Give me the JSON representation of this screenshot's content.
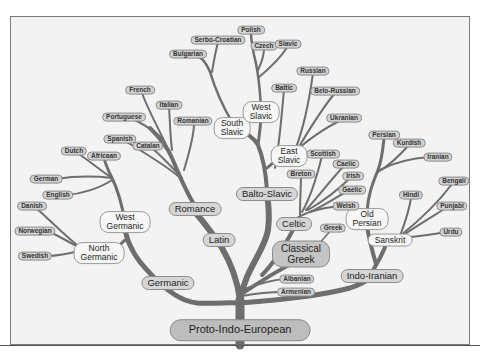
{
  "diagram": {
    "root": {
      "label": "Proto-Indo-European",
      "x": 240,
      "y": 330
    },
    "major_branches": [
      {
        "label": "Germanic",
        "x": 168,
        "y": 283,
        "style": "branch"
      },
      {
        "label": "Latin",
        "x": 219,
        "y": 240,
        "style": "branch"
      },
      {
        "label": "Romance",
        "x": 195,
        "y": 209,
        "style": "branch"
      },
      {
        "label": "Balto-Slavic",
        "x": 267,
        "y": 194,
        "style": "branch"
      },
      {
        "label": "Celtic",
        "x": 294,
        "y": 224,
        "style": "branch"
      },
      {
        "label": "Classical Greek",
        "x": 301,
        "y": 254,
        "style": "big",
        "lines": [
          "Classical",
          "Greek"
        ]
      },
      {
        "label": "Indo-Iranian",
        "x": 372,
        "y": 276,
        "style": "branch"
      }
    ],
    "sub_branches": [
      {
        "label": "West Germanic",
        "x": 125,
        "y": 222,
        "lines": [
          "West",
          "Germanic"
        ]
      },
      {
        "label": "North Germanic",
        "x": 99,
        "y": 253,
        "lines": [
          "North",
          "Germanic"
        ]
      },
      {
        "label": "South Slavic",
        "x": 232,
        "y": 128,
        "lines": [
          "South",
          "Slavic"
        ]
      },
      {
        "label": "West Slavic",
        "x": 261,
        "y": 112,
        "lines": [
          "West",
          "Slavic"
        ]
      },
      {
        "label": "East Slavic",
        "x": 289,
        "y": 156,
        "lines": [
          "East",
          "Slavic"
        ]
      },
      {
        "label": "Old Persian",
        "x": 367,
        "y": 219,
        "lines": [
          "Old",
          "Persian"
        ]
      },
      {
        "label": "Sanskrit",
        "x": 390,
        "y": 240,
        "lines": [
          "Sanskrit"
        ]
      }
    ],
    "languages": [
      {
        "label": "Polish",
        "x": 251,
        "y": 30
      },
      {
        "label": "Serbo-Croatian",
        "x": 218,
        "y": 40
      },
      {
        "label": "Czech",
        "x": 264,
        "y": 46
      },
      {
        "label": "Slavic",
        "x": 288,
        "y": 44
      },
      {
        "label": "Bulgarian",
        "x": 188,
        "y": 54
      },
      {
        "label": "Russian",
        "x": 313,
        "y": 71
      },
      {
        "label": "Baltic",
        "x": 284,
        "y": 88
      },
      {
        "label": "Belo-Russian",
        "x": 335,
        "y": 91
      },
      {
        "label": "Ukranian",
        "x": 344,
        "y": 118
      },
      {
        "label": "French",
        "x": 140,
        "y": 90
      },
      {
        "label": "Italian",
        "x": 169,
        "y": 105
      },
      {
        "label": "Portuguese",
        "x": 124,
        "y": 117
      },
      {
        "label": "Romanian",
        "x": 193,
        "y": 121
      },
      {
        "label": "Spanish",
        "x": 120,
        "y": 139
      },
      {
        "label": "Catalan",
        "x": 148,
        "y": 146
      },
      {
        "label": "Dutch",
        "x": 74,
        "y": 151
      },
      {
        "label": "Africaan",
        "x": 104,
        "y": 156
      },
      {
        "label": "German",
        "x": 46,
        "y": 179
      },
      {
        "label": "English",
        "x": 58,
        "y": 195
      },
      {
        "label": "Danish",
        "x": 32,
        "y": 206
      },
      {
        "label": "Norwegian",
        "x": 35,
        "y": 231
      },
      {
        "label": "Swedish",
        "x": 35,
        "y": 256
      },
      {
        "label": "Scottish",
        "x": 323,
        "y": 154
      },
      {
        "label": "Caelic",
        "x": 346,
        "y": 164
      },
      {
        "label": "Breton",
        "x": 301,
        "y": 174
      },
      {
        "label": "Irish",
        "x": 353,
        "y": 176
      },
      {
        "label": "Gaelic",
        "x": 352,
        "y": 190
      },
      {
        "label": "Welsh",
        "x": 346,
        "y": 206
      },
      {
        "label": "Greek",
        "x": 333,
        "y": 228
      },
      {
        "label": "Persian",
        "x": 384,
        "y": 135
      },
      {
        "label": "Kurdish",
        "x": 409,
        "y": 143
      },
      {
        "label": "Iranian",
        "x": 438,
        "y": 157
      },
      {
        "label": "Hindi",
        "x": 411,
        "y": 195
      },
      {
        "label": "Bengali",
        "x": 454,
        "y": 181
      },
      {
        "label": "Punjabi",
        "x": 452,
        "y": 206
      },
      {
        "label": "Urdu",
        "x": 451,
        "y": 232
      },
      {
        "label": "Albanian",
        "x": 297,
        "y": 279
      },
      {
        "label": "Armenian",
        "x": 296,
        "y": 292
      }
    ],
    "colors": {
      "background": "#f3f3f3",
      "branch": "#6e6e6e",
      "label_fill": "#d2d2d2",
      "label_border": "#8c8c8c",
      "frame_border": "#7a7a7a"
    }
  }
}
